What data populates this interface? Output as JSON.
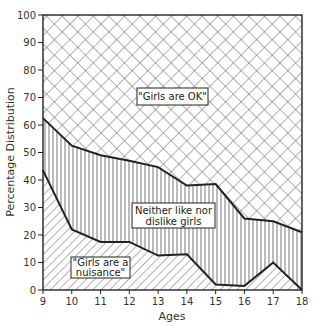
{
  "chart_data": {
    "type": "area",
    "stacked": true,
    "title": "",
    "xlabel": "Ages",
    "ylabel": "Percentage Distribution",
    "x": [
      9,
      10,
      11,
      12,
      13,
      14,
      15,
      16,
      17,
      18
    ],
    "xticks": [
      "9",
      "10",
      "11",
      "12",
      "13",
      "14",
      "15",
      "16",
      "17",
      "18"
    ],
    "yticks": [
      "0",
      "10",
      "20",
      "30",
      "40",
      "50",
      "60",
      "70",
      "80",
      "90",
      "100"
    ],
    "ylim": [
      0,
      100
    ],
    "xlim": [
      9,
      18
    ],
    "grid": false,
    "boundaries": {
      "upper_line": [
        62.5,
        52.5,
        49,
        47,
        44.7,
        38,
        38.5,
        26,
        25,
        21
      ],
      "lower_line": [
        43.5,
        22,
        17.5,
        17.5,
        12.5,
        13,
        2,
        1.5,
        10,
        0
      ]
    },
    "series": [
      {
        "name": "\"Girls are a nuisance\"",
        "pattern": "diagonal-hatch",
        "values": [
          43.5,
          22,
          17.5,
          17.5,
          12.5,
          13,
          2,
          1.5,
          10,
          0
        ]
      },
      {
        "name": "Neither like nor dislike girls",
        "pattern": "vertical-hatch",
        "values": [
          19,
          30.5,
          31.5,
          29.5,
          32.2,
          25,
          36.5,
          24.5,
          15,
          21
        ]
      },
      {
        "name": "\"Girls are OK\"",
        "pattern": "cross-hatch",
        "values": [
          37.5,
          47.5,
          51,
          53,
          55.3,
          62,
          61.5,
          74,
          75,
          79
        ]
      }
    ]
  },
  "labels": {
    "ok": "\"Girls are OK\"",
    "neither_line1": "Neither like nor",
    "neither_line2": "dislike girls",
    "nuisance_line1": "\"Girls are a",
    "nuisance_line2": "nuisance\""
  },
  "colors": {
    "ink": "#222222",
    "background": "#ffffff"
  }
}
